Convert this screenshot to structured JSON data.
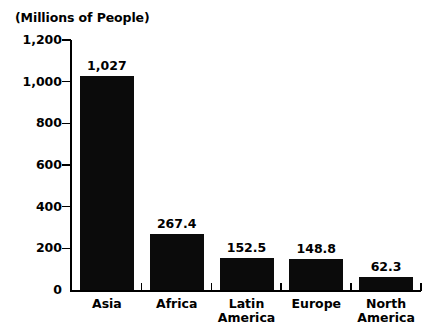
{
  "chart_data": {
    "type": "bar",
    "title": "(Millions of People)",
    "xlabel": "",
    "ylabel": "(Millions of People)",
    "categories": [
      "Asia",
      "Africa",
      "Latin\nAmerica",
      "Europe",
      "North\nAmerica"
    ],
    "values": [
      1027,
      267.4,
      152.5,
      148.8,
      62.3
    ],
    "value_labels": [
      "1,027",
      "267.4",
      "152.5",
      "148.8",
      "62.3"
    ],
    "ylim": [
      0,
      1200
    ],
    "ytick_values": [
      0,
      200,
      400,
      600,
      800,
      1000,
      1200
    ],
    "ytick_labels": [
      "0",
      "200",
      "400",
      "600",
      "800",
      "1,000",
      "1,200"
    ],
    "grid": false,
    "legend": null,
    "bar_color": "#0b0b0b",
    "background_color": "#ffffff",
    "axis_color": "#000000"
  }
}
